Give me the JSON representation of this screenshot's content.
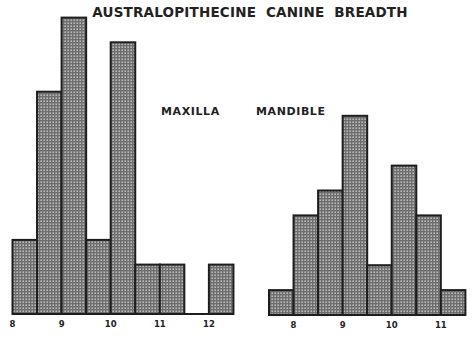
{
  "title": "AUSTRALOPITHECINE CANINE BREADTH",
  "panels": {
    "maxilla": {
      "label": "MAXILLA"
    },
    "mandible": {
      "label": "MANDIBLE"
    }
  },
  "colors": {
    "bar_fill": "#9a9a9a",
    "bar_stroke": "#1e1e1e",
    "background": "#ffffff"
  },
  "chart_data": [
    {
      "type": "bar",
      "title": "AUSTRALOPITHECINE CANINE BREADTH",
      "subtitle": "MAXILLA",
      "xlabel": "",
      "ylabel": "",
      "bin_width": 0.5,
      "bin_edges": [
        8.0,
        8.5,
        9.0,
        9.5,
        10.0,
        10.5,
        11.0,
        11.5,
        12.0,
        12.5
      ],
      "categories": [
        "8.0-8.5",
        "8.5-9.0",
        "9.0-9.5",
        "9.5-10.0",
        "10.0-10.5",
        "10.5-11.0",
        "11.0-11.5",
        "11.5-12.0",
        "12.0-12.5"
      ],
      "values": [
        3,
        9,
        12,
        3,
        11,
        2,
        2,
        0,
        2
      ],
      "x_ticks": [
        "8",
        "9",
        "10",
        "11",
        "12"
      ],
      "x_tick_values": [
        8,
        9,
        10,
        11,
        12
      ],
      "xlim": [
        8,
        12.5
      ],
      "ylim": [
        0,
        12
      ],
      "grid": false,
      "legend": null
    },
    {
      "type": "bar",
      "title": "AUSTRALOPITHECINE CANINE BREADTH",
      "subtitle": "MANDIBLE",
      "xlabel": "",
      "ylabel": "",
      "bin_width": 0.5,
      "bin_edges": [
        7.5,
        8.0,
        8.5,
        9.0,
        9.5,
        10.0,
        10.5,
        11.0,
        11.5
      ],
      "categories": [
        "7.5-8.0",
        "8.0-8.5",
        "8.5-9.0",
        "9.0-9.5",
        "9.5-10.0",
        "10.0-10.5",
        "10.5-11.0",
        "11.0-11.5"
      ],
      "values": [
        1,
        4,
        5,
        8,
        2,
        6,
        4,
        1
      ],
      "x_ticks": [
        "8",
        "9",
        "10",
        "11"
      ],
      "x_tick_values": [
        8,
        9,
        10,
        11
      ],
      "xlim": [
        7.5,
        11.5
      ],
      "ylim": [
        0,
        8
      ],
      "grid": false,
      "legend": null
    }
  ]
}
